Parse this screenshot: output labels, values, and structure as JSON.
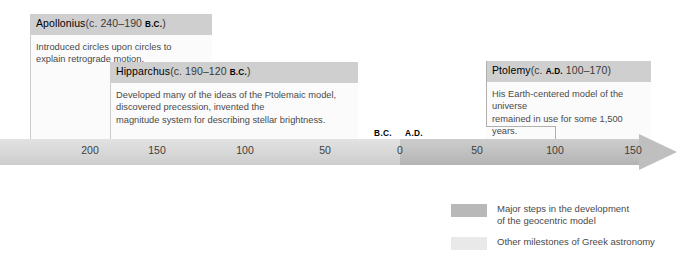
{
  "figure": {
    "type": "timeline",
    "title": ""
  },
  "callouts": [
    {
      "id": "apollonius",
      "name": "Apollonius",
      "date_prefix": "(c. 240–190 ",
      "era": "B.C.",
      "date_suffix": ")",
      "body": "Introduced circles upon circles to\nexplain retrograde motion.",
      "category": "other-milestone"
    },
    {
      "id": "hipparchus",
      "name": "Hipparchus",
      "date_prefix": "(c. 190–120 ",
      "era": "B.C.",
      "date_suffix": ")",
      "body": "Developed many of the ideas of the Ptolemaic model,\ndiscovered precession, invented the\nmagnitude system for describing stellar brightness.",
      "category": "other-milestone"
    },
    {
      "id": "ptolemy",
      "name": "Ptolemy",
      "date_prefix": "(c. ",
      "era": "A.D.",
      "date_suffix": " 100–170)",
      "body": "His Earth-centered model of the universe\nremained in use for some 1,500 years.",
      "category": "geocentric-step"
    }
  ],
  "axis": {
    "era_labels": [
      {
        "label": "B.C.",
        "x": 383
      },
      {
        "label": "A.D.",
        "x": 414
      }
    ],
    "ticks": [
      {
        "label": "200",
        "x": 90,
        "era": "B.C."
      },
      {
        "label": "150",
        "x": 157,
        "era": "B.C."
      },
      {
        "label": "100",
        "x": 245,
        "era": "B.C."
      },
      {
        "label": "50",
        "x": 325,
        "era": "B.C."
      },
      {
        "label": "0",
        "x": 400,
        "era": ""
      },
      {
        "label": "50",
        "x": 477,
        "era": "A.D."
      },
      {
        "label": "100",
        "x": 555,
        "era": "A.D."
      },
      {
        "label": "150",
        "x": 633,
        "era": "A.D."
      }
    ],
    "direction": "left-to-right",
    "arrow": true
  },
  "legend": {
    "items": [
      {
        "label": "Major steps in the development\nof the geocentric model",
        "color": "#b8b8b8"
      },
      {
        "label": "Other milestones of Greek astronomy",
        "color": "#e9e9e9"
      }
    ]
  },
  "colors": {
    "header_bg": "#cfcfcf",
    "panel_bg": "#fbfbfb",
    "bar_light": "#d9d9d9",
    "bar_dark": "#c2c2c2",
    "rule": "#cccccc",
    "text": "#4a4a4a"
  }
}
